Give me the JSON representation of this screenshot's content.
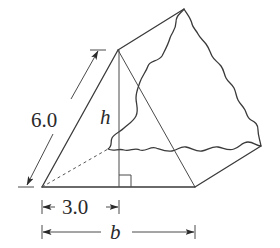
{
  "figure": {
    "labels": {
      "slant_edge": "6.0",
      "height": "h",
      "half_base": "3.0",
      "base": "b"
    },
    "markers": {
      "right_angle": "right-angle marker at foot of h"
    },
    "colors": {
      "line": "#3a3a3a",
      "background": "#ffffff"
    }
  }
}
